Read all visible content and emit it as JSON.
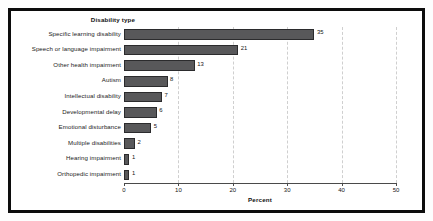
{
  "chart_data": {
    "type": "bar",
    "orientation": "horizontal",
    "title": "Disability type",
    "xlabel": "Percent",
    "ylabel": "Disability type",
    "xlim": [
      0,
      50
    ],
    "xticks": [
      0,
      10,
      20,
      30,
      40,
      50
    ],
    "grid": true,
    "grid_axis": "x",
    "legend": false,
    "bar_color": "#58585a",
    "bar_edge_color": "#2b2b2d",
    "categories": [
      "Specific learning disability",
      "Speech or language impairment",
      "Other health impairment",
      "Autism",
      "Intellectual disability",
      "Developmental delay",
      "Emotional disturbance",
      "Multiple disabilities",
      "Hearing impairment",
      "Orthopedic impairment"
    ],
    "values": [
      35,
      21,
      13,
      8,
      7,
      6,
      5,
      2,
      1,
      1
    ],
    "data_labels": [
      "35",
      "21",
      "13",
      "8",
      "7",
      "6",
      "5",
      "2",
      "1",
      "1"
    ],
    "xtick_labels": [
      "0",
      "10",
      "20",
      "30",
      "40",
      "50"
    ]
  }
}
